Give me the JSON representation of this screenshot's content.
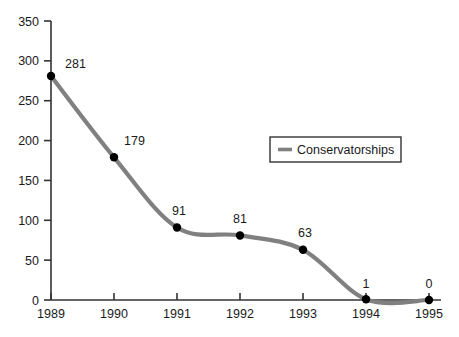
{
  "chart_data": {
    "type": "line",
    "title": "",
    "xlabel": "",
    "ylabel": "",
    "categories": [
      "1989",
      "1990",
      "1991",
      "1992",
      "1993",
      "1994",
      "1995"
    ],
    "x": [
      1989,
      1990,
      1991,
      1992,
      1993,
      1994,
      1995
    ],
    "series": [
      {
        "name": "Conservatorships",
        "values": [
          281,
          179,
          91,
          81,
          63,
          1,
          0
        ],
        "color": "#808080",
        "marker": "filled-circle",
        "marker_color": "#000000",
        "line_style": "smooth"
      }
    ],
    "point_labels": [
      "281",
      "179",
      "91",
      "81",
      "63",
      "1",
      "0"
    ],
    "ylim": [
      0,
      350
    ],
    "yticks": [
      0,
      50,
      100,
      150,
      200,
      250,
      300,
      350
    ],
    "ytick_labels": [
      "0",
      "50",
      "100",
      "150",
      "200",
      "250",
      "300",
      "350"
    ],
    "xtick_labels": [
      "1989",
      "1990",
      "1991",
      "1992",
      "1993",
      "1994",
      "1995"
    ],
    "grid": false,
    "legend": {
      "position": "upper-right-inside",
      "entries": [
        "Conservatorships"
      ]
    },
    "axis_color": "#333333",
    "background": "#ffffff"
  },
  "legend": {
    "label": "Conservatorships"
  }
}
